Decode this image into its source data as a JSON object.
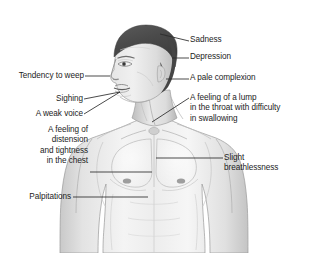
{
  "diagram": {
    "background_color": "#ffffff",
    "text_color": "#1c1c1c",
    "leader_line_color": "#2b2b2b",
    "hair_color": "#4a4a4a",
    "skin_light": "#f2f2f2",
    "skin_mid": "#d8d8d8",
    "skin_shadow": "#b0b0b0",
    "outline_color": "#8c8c8c"
  },
  "labels": {
    "sadness": {
      "text": "Sadness",
      "lines": [
        "Sadness"
      ]
    },
    "depression": {
      "text": "Depression",
      "lines": [
        "Depression"
      ]
    },
    "pale_complexion": {
      "text": "A pale complexion",
      "lines": [
        "A pale complexion"
      ]
    },
    "lump_in_throat": {
      "text": "A feeling of a lump in the throat with difficulty in swallowing",
      "lines": [
        "A feeling of a lump",
        "in the throat with difficulty",
        "in swallowing"
      ]
    },
    "slight_breathlessness": {
      "text": "Slight breathlessness",
      "lines": [
        "Slight",
        "breathlessness"
      ]
    },
    "tendency_to_weep": {
      "text": "Tendency to weep",
      "lines": [
        "Tendency to weep"
      ]
    },
    "sighing": {
      "text": "Sighing",
      "lines": [
        "Sighing"
      ]
    },
    "weak_voice": {
      "text": "A weak voice",
      "lines": [
        "A weak voice"
      ]
    },
    "chest_distension": {
      "text": "A feeling of distension and tightness in the chest",
      "lines": [
        "A feeling of",
        "distension",
        "and tightness",
        "in the chest"
      ]
    },
    "palpitations": {
      "text": "Palpitations",
      "lines": [
        "Palpitations"
      ]
    }
  }
}
